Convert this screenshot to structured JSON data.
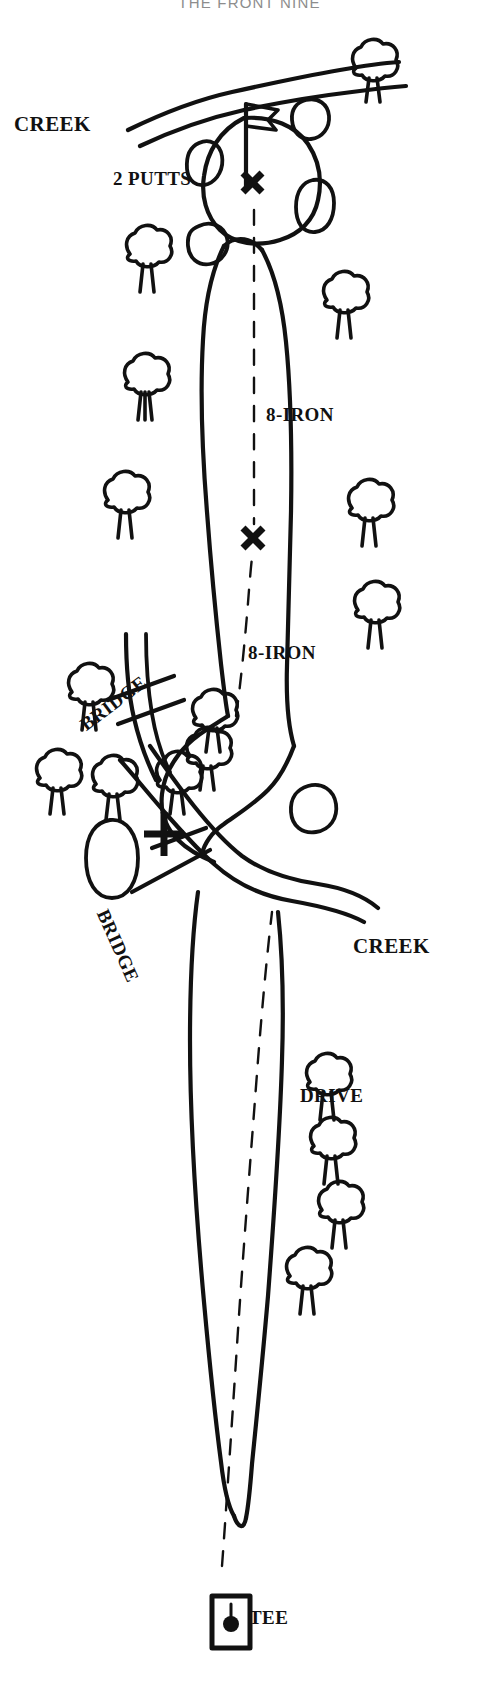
{
  "header": {
    "title": "THE FRONT NINE"
  },
  "diagram": {
    "type": "golf-hole-layout",
    "stroke_color": "#111111",
    "background_color": "#ffffff",
    "labels": {
      "creek_top": "CREEK",
      "two_putts": "2 PUTTS",
      "iron_approach": "8-IRON",
      "iron_layup": "8-IRON",
      "bridge_upper": "BRIDGE",
      "bridge_lower": "BRIDGE",
      "creek_bottom": "CREEK",
      "drive": "DRIVE",
      "tee": "TEE"
    },
    "shot_sequence": [
      {
        "order": 1,
        "label": "DRIVE",
        "marker": "dashed-line"
      },
      {
        "order": 2,
        "label": "8-IRON",
        "marker": "dashed-line"
      },
      {
        "order": 3,
        "label": "8-IRON",
        "marker": "x-ball-mark"
      },
      {
        "order": 4,
        "label": "2 PUTTS",
        "marker": "x-ball-mark"
      }
    ],
    "features": {
      "tee_box": "square tee marker with ball",
      "green": "putting green with flag pin",
      "bunkers": 5,
      "creeks": 2,
      "bridges": 2,
      "trees": 17,
      "ball_markers": 3
    }
  }
}
